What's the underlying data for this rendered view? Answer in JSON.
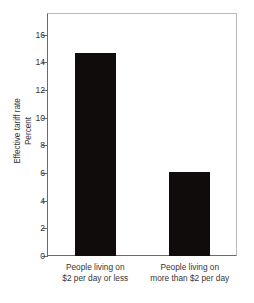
{
  "chart_data": {
    "type": "bar",
    "title": "",
    "xlabel": "",
    "ylabel": "Effective tariff rate Percent",
    "ylabel_lines": [
      "Effective tariff rate",
      "Percent"
    ],
    "categories": [
      "People living on $2 per day or less",
      "People living on more than $2 per day"
    ],
    "category_lines": [
      [
        "People living on",
        "$2 per day or less"
      ],
      [
        "People living on",
        "more than $2 per day"
      ]
    ],
    "values": [
      14.7,
      6.05
    ],
    "ylim": [
      0,
      17.5
    ],
    "yticks": [
      0,
      2,
      4,
      6,
      8,
      10,
      12,
      14,
      16
    ],
    "ytick_labels": [
      "0",
      "2",
      "4",
      "6",
      "8",
      "10",
      "12",
      "14",
      "16"
    ],
    "grid": false,
    "legend": false,
    "bar_color": "#100c0c",
    "axis_color": "#6a6a6a",
    "frame_color": "#b9b9b9"
  }
}
